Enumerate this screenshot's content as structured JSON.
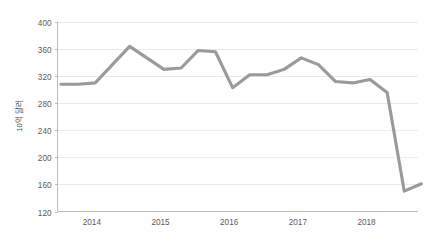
{
  "chart_data": {
    "type": "line",
    "title": "",
    "subtitle": "",
    "xlabel": "",
    "ylabel": "10억 달러",
    "ylim": [
      120,
      400
    ],
    "ytick_step": 40,
    "yticks": [
      120,
      160,
      200,
      240,
      280,
      320,
      360,
      400
    ],
    "ytick_labels": [
      "120",
      "160",
      "200",
      "240",
      "280",
      "320",
      "360",
      "400"
    ],
    "xticks": [
      2014,
      2015,
      2016,
      2017,
      2018
    ],
    "xtick_labels": [
      "2014",
      "2015",
      "2016",
      "2017",
      "2018"
    ],
    "xlim": [
      2013.5,
      2018.75
    ],
    "grid": "horizontal",
    "legend": "none",
    "series": [
      {
        "name": "",
        "color": "#9a9a9a",
        "x": [
          2013.55,
          2013.8,
          2014.05,
          2014.3,
          2014.55,
          2014.8,
          2015.05,
          2015.3,
          2015.55,
          2015.8,
          2016.05,
          2016.3,
          2016.55,
          2016.8,
          2017.05,
          2017.3,
          2017.55,
          2017.8,
          2018.05,
          2018.3,
          2018.55
        ],
        "values": [
          308,
          308,
          310,
          337,
          364,
          347,
          330,
          332,
          358,
          356,
          303,
          322,
          322,
          330,
          347,
          337,
          312,
          310,
          315,
          296,
          150
        ],
        "values_tail": [
          161
        ]
      }
    ],
    "annotations": []
  },
  "axis": {
    "y_title": "10억 달러"
  }
}
